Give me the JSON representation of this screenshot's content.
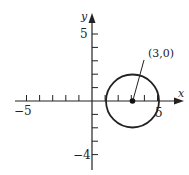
{
  "chart_data": {
    "type": "diagram",
    "title": "",
    "xlabel": "x",
    "ylabel": "y",
    "xlim": [
      -5.5,
      6.5
    ],
    "ylim": [
      -4.8,
      6
    ],
    "x_ticks": [
      -5,
      -4,
      -3,
      -2,
      -1,
      1,
      2,
      3,
      4,
      5
    ],
    "y_ticks": [
      -4,
      -3,
      -2,
      -1,
      1,
      2,
      3,
      4,
      5
    ],
    "x_tick_labels": {
      "-5": "-5",
      "5": "5"
    },
    "y_tick_labels": {
      "5": "5",
      "-4": "-4"
    },
    "shapes": [
      {
        "type": "circle",
        "center": [
          3,
          0
        ],
        "radius": 2
      }
    ],
    "points": [
      {
        "x": 3,
        "y": 0,
        "label": "(3,0)"
      }
    ],
    "annotations": [
      {
        "text": "(3,0)",
        "points_to": [
          3,
          0
        ]
      }
    ]
  },
  "labels": {
    "x_axis": "x",
    "y_axis": "y",
    "x_min_tick": "−5",
    "x_max_tick": "5",
    "y_max_tick": "5",
    "y_min_tick": "−4",
    "center_annotation": "(3,0)"
  },
  "colors": {
    "stroke": "#222222",
    "background": "#ffffff"
  }
}
